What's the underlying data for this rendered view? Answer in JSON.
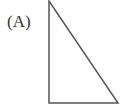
{
  "figure": {
    "label": "(A)",
    "shape": "right-triangle",
    "stroke_color": "#555555",
    "vertices": [
      [
        49,
        1
      ],
      [
        49,
        103
      ],
      [
        118,
        103
      ]
    ]
  }
}
